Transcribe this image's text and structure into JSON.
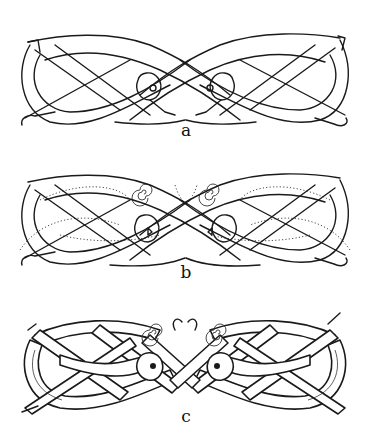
{
  "figure": {
    "panels": [
      {
        "id": "a",
        "label": "a",
        "stage": "construction lines"
      },
      {
        "id": "b",
        "label": "b",
        "stage": "construction lines with dotted guides and spirals"
      },
      {
        "id": "c",
        "label": "c",
        "stage": "finished ribbon interlace"
      }
    ]
  },
  "colors": {
    "ink": "#1a1a1a",
    "background": "#ffffff"
  }
}
